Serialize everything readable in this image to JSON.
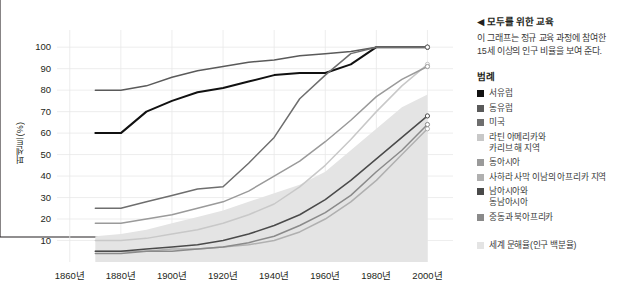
{
  "side": {
    "title": "◀ 모두를 위한 교육",
    "description": "이 그래프는 정규 교육 과정에 참여한 15세 이상의 인구 비율을 보여 준다.",
    "legend_title": "범례",
    "world_label": "세계 문해율(인구 백분율)"
  },
  "chart_data": {
    "type": "line",
    "title": "모두를 위한 교육",
    "xlabel": "",
    "ylabel": "퍼센트(%)",
    "x_tick_labels": [
      "1860년",
      "1880년",
      "1900년",
      "1920년",
      "1940년",
      "1960년",
      "1980년",
      "2000년"
    ],
    "x_ticks": [
      1860,
      1880,
      1900,
      1920,
      1940,
      1960,
      1980,
      2000
    ],
    "y_tick_labels": [
      "10",
      "20",
      "30",
      "40",
      "50",
      "60",
      "70",
      "80",
      "90",
      "100"
    ],
    "y_ticks": [
      10,
      20,
      30,
      40,
      50,
      60,
      70,
      80,
      90,
      100
    ],
    "xlim": [
      1855,
      2010
    ],
    "ylim": [
      0,
      108
    ],
    "grid": true,
    "legend_position": "right",
    "x": [
      1870,
      1880,
      1890,
      1900,
      1910,
      1920,
      1930,
      1940,
      1950,
      1960,
      1970,
      1980,
      1990,
      2000
    ],
    "series": [
      {
        "name": "서유럽",
        "color": "#111111",
        "values": [
          60,
          60,
          70,
          75,
          79,
          81,
          84,
          87,
          88,
          88,
          92,
          100,
          100,
          100
        ]
      },
      {
        "name": "동유럽",
        "color": "#5a5a5a",
        "values": [
          80,
          80,
          82,
          86,
          89,
          91,
          93,
          94,
          96,
          97,
          98,
          100,
          100,
          100
        ]
      },
      {
        "name": "미국",
        "color": "#6e6e6e",
        "values": [
          25,
          25,
          28,
          31,
          34,
          35,
          46,
          58,
          76,
          87,
          97,
          100,
          100,
          100
        ]
      },
      {
        "name": "라틴 아메리카와\n카리브 해 지역",
        "color": "#c8c8c8",
        "values": [
          10,
          10,
          11,
          13,
          15,
          18,
          22,
          27,
          35,
          45,
          57,
          70,
          82,
          92
        ]
      },
      {
        "name": "동아시아",
        "color": "#9a9a9a",
        "values": [
          18,
          18,
          20,
          22,
          25,
          28,
          33,
          40,
          47,
          56,
          66,
          77,
          85,
          91
        ]
      },
      {
        "name": "사하라 사막 이남의 아프리카 지역",
        "color": "#b0b0b0",
        "values": [
          5,
          5,
          5,
          6,
          6,
          7,
          8,
          10,
          14,
          20,
          28,
          38,
          50,
          62
        ]
      },
      {
        "name": "남아시아와\n동남아시아",
        "color": "#4a4a4a",
        "values": [
          5,
          5,
          6,
          7,
          8,
          10,
          13,
          17,
          22,
          29,
          38,
          48,
          58,
          68
        ]
      },
      {
        "name": "중동과 북아프리카",
        "color": "#8a8a8a",
        "values": [
          4,
          4,
          5,
          5,
          6,
          7,
          9,
          12,
          17,
          23,
          31,
          42,
          52,
          64
        ]
      }
    ],
    "area": {
      "name": "세계 문해율(인구 백분율)",
      "color": "#e4e4e4",
      "values": [
        12,
        13,
        15,
        18,
        21,
        24,
        28,
        32,
        36,
        42,
        52,
        62,
        72,
        78
      ]
    }
  }
}
